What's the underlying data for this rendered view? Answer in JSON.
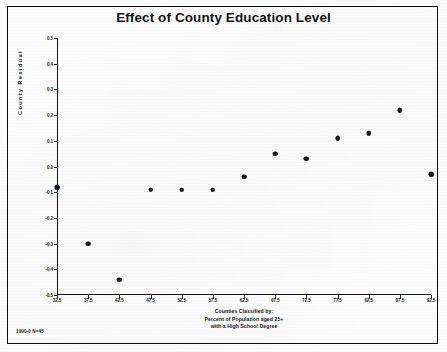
{
  "figure": {
    "title": "Effect of County Education Level",
    "footer": "1990-0 N=45"
  },
  "chart_data": {
    "type": "scatter",
    "title": "Effect of County Education Level",
    "xlabel": "Counties Classified by:\nPercent of Population aged 25+\nwith a High School Degree",
    "xlabel_lines": [
      "Counties Classified by:",
      "Percent of Population aged 25+",
      "with a High School Degree"
    ],
    "ylabel": "County Residual",
    "xlim": [
      32.5,
      92.5
    ],
    "ylim": [
      -0.5,
      0.5
    ],
    "grid": false,
    "legend": null,
    "xticks": [
      32.5,
      37.5,
      42.5,
      47.5,
      52.5,
      57.5,
      62.5,
      67.5,
      72.5,
      77.5,
      82.5,
      87.5,
      92.5
    ],
    "xtick_labels": [
      "32.5",
      "37.5",
      "42.5",
      "47.5",
      "52.5",
      "57.5",
      "62.5",
      "67.5",
      "72.5",
      "77.5",
      "82.5",
      "87.5",
      "92.5"
    ],
    "yticks": [
      0.5,
      0.4,
      0.3,
      0.2,
      0.1,
      0.0,
      -0.1,
      -0.2,
      -0.3,
      -0.4,
      -0.5
    ],
    "ytick_labels": [
      "0.5",
      "0.4",
      "0.3",
      "0.2",
      "0.1",
      "0.0",
      "-0.1",
      "-0.2",
      "-0.3",
      "-0.4",
      "-0.5"
    ],
    "x": [
      32.5,
      37.5,
      42.5,
      47.5,
      52.5,
      57.5,
      62.5,
      67.5,
      72.5,
      77.5,
      82.5,
      87.5,
      92.5
    ],
    "y": [
      -0.08,
      -0.3,
      -0.44,
      -0.09,
      -0.09,
      -0.09,
      -0.04,
      0.05,
      0.03,
      0.11,
      0.13,
      0.22,
      -0.03
    ],
    "points": [
      {
        "x": 32.5,
        "y": -0.08
      },
      {
        "x": 37.5,
        "y": -0.3
      },
      {
        "x": 42.5,
        "y": -0.44
      },
      {
        "x": 47.5,
        "y": -0.09
      },
      {
        "x": 52.5,
        "y": -0.09
      },
      {
        "x": 57.5,
        "y": -0.09
      },
      {
        "x": 62.5,
        "y": -0.04
      },
      {
        "x": 67.5,
        "y": 0.05
      },
      {
        "x": 72.5,
        "y": 0.03
      },
      {
        "x": 77.5,
        "y": 0.11
      },
      {
        "x": 82.5,
        "y": 0.13
      },
      {
        "x": 87.5,
        "y": 0.22
      },
      {
        "x": 92.5,
        "y": -0.03
      }
    ]
  }
}
